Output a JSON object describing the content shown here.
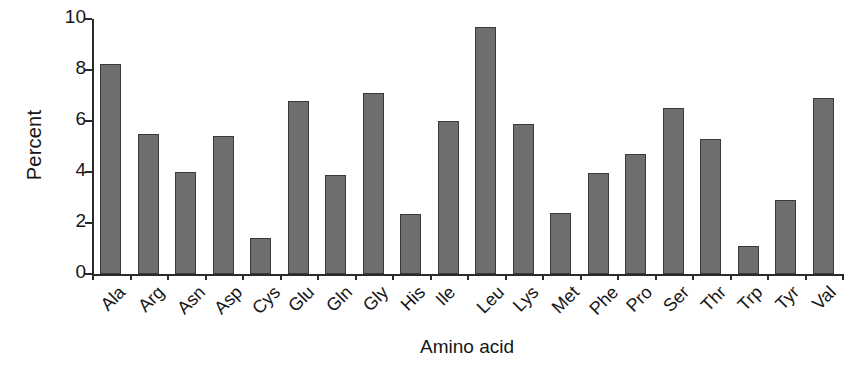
{
  "chart_data": {
    "type": "bar",
    "title": "",
    "xlabel": "Amino acid",
    "ylabel": "Percent",
    "categories": [
      "Ala",
      "Arg",
      "Asn",
      "Asp",
      "Cys",
      "Glu",
      "Gln",
      "Gly",
      "His",
      "Ile",
      "Leu",
      "Lys",
      "Met",
      "Phe",
      "Pro",
      "Ser",
      "Thr",
      "Trp",
      "Tyr",
      "Val"
    ],
    "values": [
      8.25,
      5.5,
      4.0,
      5.4,
      1.4,
      6.8,
      3.9,
      7.1,
      2.35,
      6.0,
      9.7,
      5.9,
      2.4,
      3.95,
      4.7,
      6.5,
      5.3,
      1.1,
      2.9,
      6.9
    ],
    "ylim": [
      0,
      10
    ],
    "yticks": [
      0,
      2,
      4,
      6,
      8,
      10
    ],
    "ytick_labels": [
      "0",
      "2",
      "4",
      "6",
      "8",
      "10"
    ],
    "grid": false,
    "legend": null,
    "bar_color": "#6e6e6e",
    "bar_edge_color": "#3a3a3a",
    "axis_color": "#2b2b2b",
    "background": "#ffffff"
  }
}
